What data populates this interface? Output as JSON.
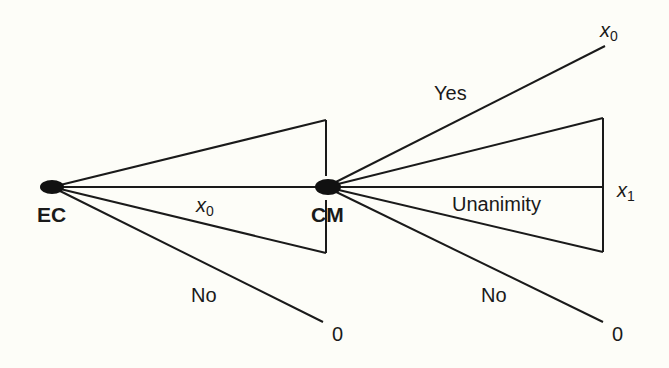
{
  "diagram": {
    "type": "game-tree",
    "colors": {
      "line": "#1a1a1a",
      "background": "#fdfdf8",
      "node": "#111111"
    },
    "nodes": [
      {
        "id": "EC",
        "label": "EC"
      },
      {
        "id": "CM",
        "label": "CM"
      }
    ],
    "edges": {
      "ec_to_cm": {
        "label_var": "x",
        "label_sub": "0"
      },
      "ec_no": {
        "label": "No",
        "payoff": "0"
      },
      "cm_yes": {
        "label": "Yes",
        "payoff_var": "x",
        "payoff_sub": "0"
      },
      "cm_unanimity": {
        "label": "Unanimity",
        "payoff_var": "x",
        "payoff_sub": "1"
      },
      "cm_no": {
        "label": "No",
        "payoff": "0"
      }
    }
  }
}
